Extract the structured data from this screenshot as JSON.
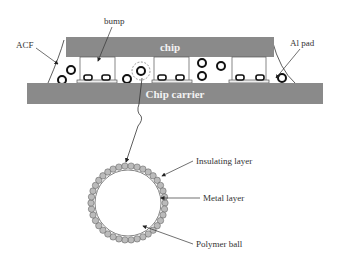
{
  "diagram": {
    "colors": {
      "chip": "#8a8a8a",
      "carrier": "#8a8a8a",
      "block_text": "#f2f2f2",
      "line": "#333333",
      "particle_shell": "#a6a6a6"
    },
    "blocks": {
      "chip": "chip",
      "carrier": "Chip carrier"
    },
    "labels": {
      "acf": "ACF",
      "bump": "bump",
      "al_pad": "Al pad",
      "insulating": "Insulating layer",
      "metal": "Metal layer",
      "polymer": "Polymer ball"
    }
  }
}
